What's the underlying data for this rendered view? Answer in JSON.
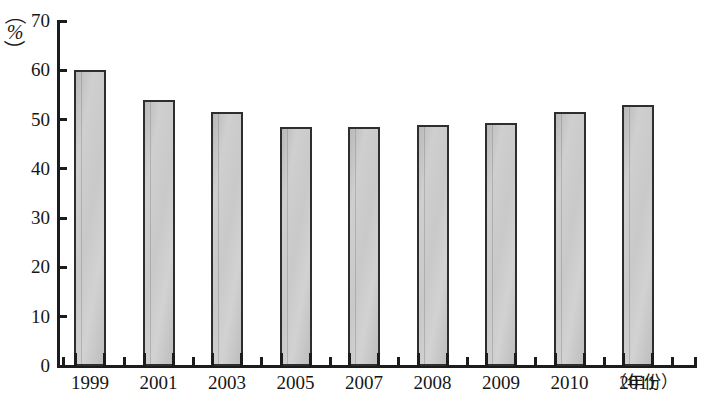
{
  "chart_data": {
    "type": "bar",
    "title": "",
    "subtitle": "",
    "xlabel": "（年份）",
    "ylabel": "（%）",
    "categories": [
      "1999",
      "2001",
      "2003",
      "2005",
      "2007",
      "2008",
      "2009",
      "2010",
      "2011"
    ],
    "values": [
      60,
      54,
      51.5,
      48.5,
      48.5,
      49,
      49.3,
      51.5,
      53
    ],
    "series": [
      {
        "name": "",
        "values": [
          60,
          54,
          51.5,
          48.5,
          48.5,
          49,
          49.3,
          51.5,
          53
        ]
      }
    ],
    "ylim": [
      0,
      70
    ],
    "y_ticks": [
      0,
      10,
      20,
      30,
      40,
      50,
      60,
      70
    ],
    "y_tick_labels": [
      "0",
      "10",
      "20",
      "30",
      "40",
      "50",
      "60",
      "70"
    ],
    "grid": false,
    "legend": false,
    "legend_position": "none",
    "bar_fill_color": "#c9c9c9",
    "bar_border_color": "#2e2e2e",
    "axis_color": "#1c1c1c",
    "background_color": "#ffffff"
  },
  "axis": {
    "y_unit_paren_open": "（",
    "y_unit_symbol": "%",
    "y_unit_paren_close": "）",
    "x_unit_text": "（年份）"
  }
}
